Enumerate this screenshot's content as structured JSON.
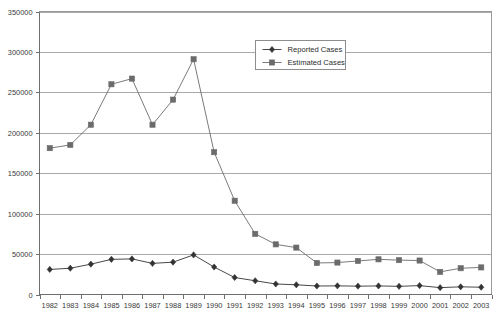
{
  "chart_data": {
    "type": "line",
    "title": "",
    "subtitle": "",
    "xlabel": "",
    "ylabel": "",
    "grid": true,
    "legend_position": "top-center-inside",
    "categories": [
      "1982",
      "1983",
      "1984",
      "1985",
      "1986",
      "1987",
      "1988",
      "1989",
      "1990",
      "1991",
      "1992",
      "1993",
      "1994",
      "1995",
      "1996",
      "1997",
      "1998",
      "1999",
      "2000",
      "2001",
      "2002",
      "2003"
    ],
    "ylim": [
      0,
      350000
    ],
    "yticks": [
      0,
      50000,
      100000,
      150000,
      200000,
      250000,
      300000,
      350000
    ],
    "ytick_labels": [
      "0",
      "50000",
      "100000",
      "150000",
      "200000",
      "250000",
      "300000",
      "350000"
    ],
    "series": [
      {
        "name": "Reported Cases",
        "marker": "diamond",
        "color": "#333333",
        "values": [
          31000,
          32500,
          37500,
          43500,
          44000,
          38500,
          40000,
          49000,
          34000,
          21000,
          17000,
          13000,
          12000,
          10500,
          10700,
          10300,
          10600,
          10100,
          11000,
          8500,
          9500,
          9000
        ]
      },
      {
        "name": "Estimated Cases",
        "marker": "square",
        "color": "#6b6b6b",
        "values": [
          181000,
          185000,
          210000,
          260000,
          267000,
          210000,
          241000,
          291000,
          176000,
          116000,
          75000,
          62000,
          58000,
          39000,
          39500,
          41500,
          43500,
          42500,
          42000,
          28000,
          32500,
          33500
        ]
      }
    ]
  }
}
